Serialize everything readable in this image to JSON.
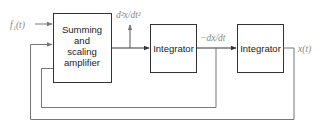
{
  "diagram": {
    "type": "block-diagram",
    "blocks": [
      {
        "id": "summing",
        "lines": [
          "Summing",
          "and",
          "scaling",
          "amplifier"
        ]
      },
      {
        "id": "integrator1",
        "label": "Integrator"
      },
      {
        "id": "integrator2",
        "label": "Integrator"
      }
    ],
    "signals": {
      "input": "f₁(t)",
      "second_derivative": "d²x/dt²",
      "first_derivative": "−dx/dt",
      "output": "x(t)"
    },
    "colors": {
      "block_stroke": "#333333",
      "feedback_line": "#777777",
      "signal_text": "#888888"
    }
  }
}
